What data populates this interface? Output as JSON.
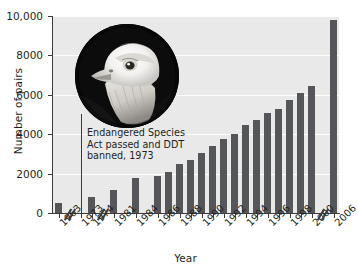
{
  "chart_data": {
    "type": "bar",
    "title": "",
    "xlabel": "Year",
    "ylabel": "Number of pairs",
    "ylim": [
      0,
      10000
    ],
    "yticks": [
      0,
      2000,
      4000,
      6000,
      8000,
      10000
    ],
    "ytick_labels": [
      "0",
      "2000",
      "4000",
      "6000",
      "8000",
      "10,000"
    ],
    "grid": "horizontal-white",
    "legend": "none",
    "axis_breaks": [
      {
        "after_category": "1963",
        "label": "//"
      },
      {
        "after_category": "1974",
        "label": "//"
      },
      {
        "after_category": "2000",
        "label": "//"
      }
    ],
    "categories": [
      "1963",
      "1974",
      "1981",
      "1984",
      "1986",
      "1987",
      "1988",
      "1989",
      "1990",
      "1991",
      "1992",
      "1993",
      "1994",
      "1995",
      "1996",
      "1997",
      "1998",
      "1999",
      "2000",
      "2006"
    ],
    "values": [
      487,
      791,
      1188,
      1757,
      1875,
      2075,
      2475,
      2680,
      3035,
      3399,
      3749,
      4015,
      4449,
      4712,
      5094,
      5295,
      5748,
      6104,
      6471,
      9789
    ],
    "tick_categories": [
      "1963",
      "1973",
      "1974",
      "1981",
      "1984",
      "1986",
      "1988",
      "1990",
      "1992",
      "1994",
      "1996",
      "1998",
      "2000",
      "2006"
    ],
    "annotations": [
      {
        "text_lines": [
          "Endangered Species",
          "Act passed and DDT",
          "banned, 1973"
        ],
        "points_to_category": "1973"
      }
    ],
    "image_inset": {
      "name": "bald-eagle-photo",
      "shape": "circle",
      "description": "Bald eagle head portrait"
    }
  },
  "colors": {
    "bar": "#555659",
    "plot_background": "#e9e9e9",
    "gridline": "#ffffff",
    "axis": "#3c3c3c",
    "text": "#231f20",
    "page_background": "#ffffff"
  }
}
